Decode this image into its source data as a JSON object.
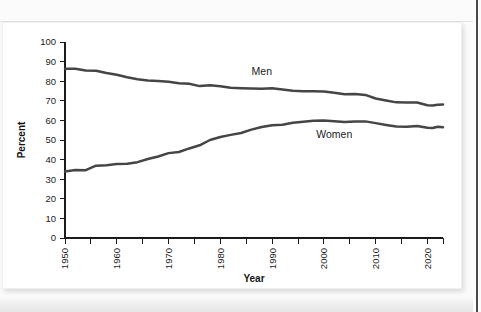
{
  "figure": {
    "background_color": "#ffffff",
    "page_background_color": "#fbfbfb",
    "line_color": "#454545",
    "axis_color": "#1b1b1b"
  },
  "chart_data": {
    "type": "line",
    "title": "",
    "subtitle": "",
    "xlabel": "Year",
    "ylabel": "Percent",
    "xlim": [
      1950,
      2023
    ],
    "ylim": [
      0,
      100
    ],
    "grid": false,
    "legend_position": "inline-annotations",
    "y_ticks": [
      0,
      10,
      20,
      30,
      40,
      50,
      60,
      70,
      80,
      90,
      100
    ],
    "y_tick_labels": [
      "0",
      "10",
      "20",
      "30",
      "40",
      "50",
      "60",
      "70",
      "80",
      "90",
      "100"
    ],
    "x_ticks": [
      1950,
      1960,
      1970,
      1980,
      1990,
      2000,
      2010,
      2020
    ],
    "x_tick_labels": [
      "1950",
      "1960",
      "1970",
      "1980",
      "1990",
      "2000",
      "2010",
      "2020"
    ],
    "x_minor_ticks": [
      1950,
      1955,
      1960,
      1965,
      1970,
      1975,
      1980,
      1985,
      1990,
      1995,
      2000,
      2005,
      2010,
      2015,
      2020,
      2023
    ],
    "annotations": [
      {
        "text": "Men",
        "x": 1988,
        "y": 83
      },
      {
        "text": "Women",
        "x": 2002,
        "y": 51
      }
    ],
    "x": [
      1950,
      1952,
      1954,
      1956,
      1958,
      1960,
      1962,
      1964,
      1966,
      1968,
      1970,
      1972,
      1974,
      1976,
      1978,
      1980,
      1982,
      1984,
      1986,
      1988,
      1990,
      1992,
      1994,
      1996,
      1998,
      2000,
      2002,
      2004,
      2006,
      2008,
      2010,
      2012,
      2014,
      2016,
      2018,
      2020,
      2021,
      2022,
      2023
    ],
    "series": [
      {
        "name": "Men",
        "color": "#454545",
        "values": [
          86.4,
          86.3,
          85.5,
          85.3,
          84.2,
          83.3,
          82.0,
          81.0,
          80.4,
          80.1,
          79.7,
          79.0,
          78.7,
          77.5,
          77.9,
          77.4,
          76.6,
          76.4,
          76.3,
          76.2,
          76.4,
          75.8,
          75.1,
          74.9,
          74.9,
          74.8,
          74.1,
          73.3,
          73.5,
          73.0,
          71.2,
          70.2,
          69.2,
          69.1,
          69.1,
          67.7,
          67.6,
          68.0,
          68.1
        ]
      },
      {
        "name": "Women",
        "color": "#454545",
        "values": [
          33.9,
          34.7,
          34.6,
          36.9,
          37.1,
          37.7,
          37.9,
          38.7,
          40.3,
          41.6,
          43.3,
          43.9,
          45.7,
          47.3,
          50.0,
          51.5,
          52.6,
          53.6,
          55.3,
          56.6,
          57.5,
          57.8,
          58.8,
          59.3,
          59.8,
          59.9,
          59.6,
          59.2,
          59.4,
          59.5,
          58.6,
          57.7,
          56.9,
          56.8,
          57.1,
          56.2,
          56.1,
          56.8,
          56.5
        ]
      }
    ]
  }
}
